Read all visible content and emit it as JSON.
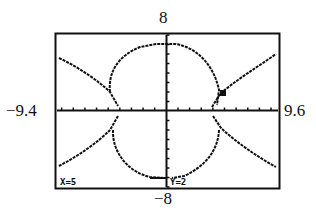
{
  "window": {
    "xmin_label": "−9.4",
    "xmax_label": "9.6",
    "ymax_label": "8",
    "ymin_label": "−8"
  },
  "trace": {
    "x_readout": "X=5",
    "y_readout": "Y=2",
    "cursor": {
      "x": 5,
      "y": 2
    }
  },
  "colors": {
    "ink": "#111111",
    "background": "#ffffff"
  },
  "chart_data": {
    "type": "line",
    "title": "",
    "xlabel": "",
    "ylabel": "",
    "xlim": [
      -9.4,
      9.6
    ],
    "ylim": [
      -8,
      8
    ],
    "grid": false,
    "x_tick_spacing": 1,
    "y_tick_spacing": 1,
    "series": [
      {
        "name": "circle (upper/lower halves)",
        "description": "circle centered at origin, radius ~7, with gaps near the x-axis",
        "points_sample": [
          [
            0,
            7
          ],
          [
            -5.4,
            1.6
          ],
          [
            5.1,
            2.4
          ],
          [
            0,
            -7
          ],
          [
            -5.4,
            -1.6
          ],
          [
            5.1,
            -2.4
          ]
        ]
      },
      {
        "name": "hyperbola branches",
        "description": "left and right branches opening horizontally, passing through (5, 2)",
        "points_sample": [
          [
            -9.4,
            5.6
          ],
          [
            -5.2,
            0.3
          ],
          [
            5,
            2
          ],
          [
            9.6,
            5.6
          ],
          [
            -9.4,
            -5.6
          ],
          [
            9.6,
            -5.6
          ]
        ]
      }
    ],
    "annotations": [
      {
        "type": "trace-cursor",
        "x": 5,
        "y": 2,
        "text": "X=5 Y=2"
      }
    ]
  }
}
